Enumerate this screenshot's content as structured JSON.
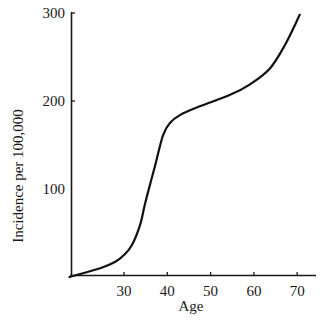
{
  "chart_data": {
    "type": "line",
    "title": "",
    "xlabel": "Age",
    "ylabel": "Incidence per 100,000",
    "xlim": [
      17,
      74
    ],
    "ylim": [
      0,
      305
    ],
    "grid": false,
    "legend": null,
    "x_ticks": [
      30,
      40,
      50,
      60,
      70
    ],
    "y_ticks": [
      100,
      200,
      300
    ],
    "series": [
      {
        "name": "Incidence",
        "x": [
          17.4,
          24.5,
          27.9,
          30,
          31.8,
          33.7,
          34.8,
          36,
          37.2,
          39,
          40.6,
          42.9,
          47.5,
          54.5,
          59.1,
          63.7,
          67.2,
          70.6
        ],
        "y": [
          0,
          10,
          17,
          25,
          36,
          59,
          82,
          105,
          127,
          161,
          175,
          184,
          194,
          207,
          219,
          237,
          264,
          298
        ]
      }
    ]
  },
  "axes": {
    "x_label": "Age",
    "y_label": "Incidence per 100,000",
    "x_tick_labels": [
      "30",
      "40",
      "50",
      "60",
      "70"
    ],
    "y_tick_labels": [
      "100",
      "200",
      "300"
    ]
  }
}
